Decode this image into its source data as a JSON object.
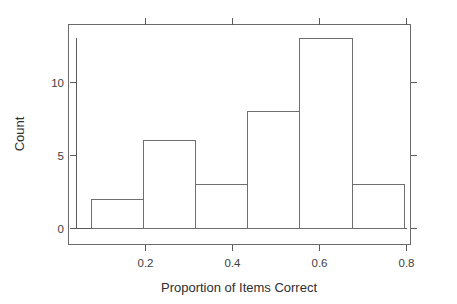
{
  "chart_data": {
    "type": "bar",
    "title": "",
    "subtitle": "",
    "xlabel": "Proportion of Items Correct",
    "ylabel": "Count",
    "categories": [
      "0.075-0.195",
      "0.195-0.315",
      "0.315-0.435",
      "0.435-0.555",
      "0.555-0.675",
      "0.675-0.795"
    ],
    "bin_edges": [
      0.075,
      0.195,
      0.315,
      0.435,
      0.555,
      0.675,
      0.795
    ],
    "values": [
      2,
      6,
      3,
      8,
      13,
      3
    ],
    "bin_width": 0.12,
    "xlim": [
      0.05,
      0.83
    ],
    "ylim": [
      0,
      13.8
    ],
    "xticks": [
      0.2,
      0.4,
      0.6,
      0.8
    ],
    "xtick_labels": [
      "0.2",
      "0.4",
      "0.6",
      "0.8"
    ],
    "yticks": [
      0,
      5,
      10
    ],
    "ytick_labels": [
      "0",
      "5",
      "10"
    ],
    "grid": false,
    "legend": false,
    "legend_position": "none",
    "bar_fill": "#ffffff",
    "bar_stroke": "#6e6e6e",
    "axis_color": "#5a5a5a",
    "background": "#ffffff",
    "frame": "box",
    "tick_side": "both"
  },
  "axes": {
    "x_title": "Proportion of Items Correct",
    "y_title": "Count",
    "x_tick_0": "0.2",
    "x_tick_1": "0.4",
    "x_tick_2": "0.6",
    "x_tick_3": "0.8",
    "y_tick_0": "0",
    "y_tick_1": "5",
    "y_tick_2": "10"
  }
}
